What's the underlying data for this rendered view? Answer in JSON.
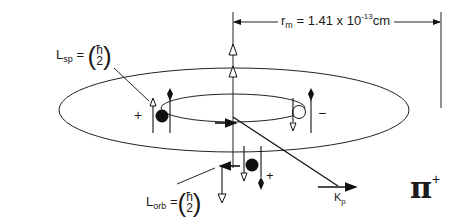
{
  "radius_label": {
    "symbol": "r",
    "subscript": "m",
    "equals": "= 1.41 x 10",
    "exponent": "-13",
    "unit": "cm"
  },
  "spin_label": {
    "symbol": "L",
    "subscript": "sp",
    "equals": "=",
    "numerator": "ħ",
    "denominator": "2"
  },
  "orbital_label": {
    "symbol": "L",
    "subscript": "orb",
    "equals": "=",
    "numerator": "ħ",
    "denominator": "2"
  },
  "momentum_label": {
    "symbol": "K",
    "subscript": "p"
  },
  "particle_label": {
    "symbol": "π",
    "charge": "+"
  },
  "charges": {
    "left": "+",
    "right": "−",
    "front": "+"
  }
}
